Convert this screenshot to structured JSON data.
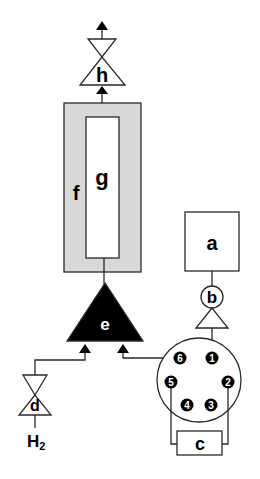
{
  "diagram": {
    "colors": {
      "stroke": "#2a2a2a",
      "furnace_fill": "#d8d8d8",
      "injector_fill": "#000000",
      "background": "#ffffff"
    },
    "components": {
      "a": {
        "label": "a",
        "shape": "box"
      },
      "b": {
        "label": "b",
        "shape": "circle-valve"
      },
      "c": {
        "label": "c",
        "shape": "box"
      },
      "d": {
        "label": "d",
        "shape": "needle-valve"
      },
      "e": {
        "label": "e",
        "shape": "filled-triangle"
      },
      "f": {
        "label": "f",
        "shape": "shaded-box"
      },
      "g": {
        "label": "g",
        "shape": "column-box"
      },
      "h": {
        "label": "h",
        "shape": "needle-valve"
      }
    },
    "gas_label": {
      "main": "H",
      "subscript": "2"
    },
    "valve_ports": [
      "1",
      "2",
      "3",
      "4",
      "5",
      "6"
    ]
  }
}
